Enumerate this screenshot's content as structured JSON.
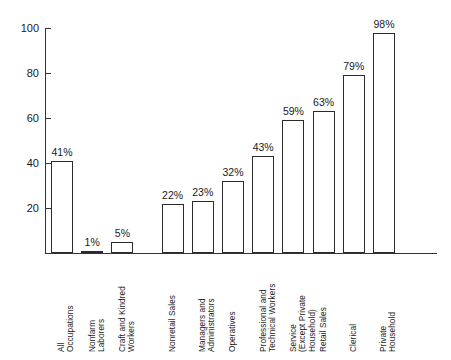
{
  "chart_data": {
    "type": "bar",
    "title": "",
    "xlabel": "",
    "ylabel": "",
    "ylim": [
      0,
      100
    ],
    "yticks": [
      100,
      80,
      60,
      40,
      20
    ],
    "grid": false,
    "legend": null,
    "categories": [
      "All Occupations",
      "Nonfarm Laborers",
      "Craft and Kindred Workers",
      "Nonretail Sales",
      "Managers and Administrators",
      "Operatives",
      "Professional and Technical Workers",
      "Service (Except Private Household)",
      "Retail Sales",
      "Clerical",
      "Private Household"
    ],
    "values": [
      41,
      1,
      5,
      22,
      23,
      32,
      43,
      59,
      63,
      79,
      98
    ],
    "data_labels": [
      "41%",
      "1%",
      "5%",
      "22%",
      "23%",
      "32%",
      "43%",
      "59%",
      "63%",
      "79%",
      "98%"
    ],
    "bar_style": {
      "fill": "#ffffff",
      "stroke": "#2b2b2b"
    },
    "axis_color": "#333333",
    "text_color": "#1a1a1a",
    "background": "#ffffff"
  }
}
